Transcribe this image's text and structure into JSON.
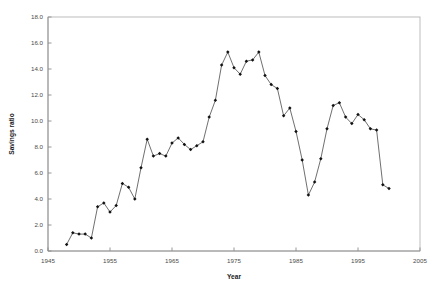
{
  "chart_data": {
    "type": "line",
    "title": "",
    "xlabel": "Year",
    "ylabel": "Savings ratio",
    "xlim": [
      1945,
      2005
    ],
    "ylim": [
      0.0,
      18.0
    ],
    "xticks": [
      1945,
      1955,
      1965,
      1975,
      1985,
      1995,
      2005
    ],
    "xtick_labels": [
      "1945",
      "1955",
      "1965",
      "1975",
      "1985",
      "1995",
      "2005"
    ],
    "yticks": [
      0.0,
      2.0,
      4.0,
      6.0,
      8.0,
      10.0,
      12.0,
      14.0,
      16.0,
      18.0
    ],
    "ytick_labels": [
      "0.0",
      "2.0",
      "4.0",
      "6.0",
      "8.0",
      "10.0",
      "12.0",
      "14.0",
      "16.0",
      "18.0"
    ],
    "grid": false,
    "legend": false,
    "marker": "filled-diamond",
    "line_color": "#555555",
    "marker_color": "#111111",
    "series": [
      {
        "name": "Savings ratio",
        "x": [
          1948,
          1949,
          1950,
          1951,
          1952,
          1953,
          1954,
          1955,
          1956,
          1957,
          1958,
          1959,
          1960,
          1961,
          1962,
          1963,
          1964,
          1965,
          1966,
          1967,
          1968,
          1969,
          1970,
          1971,
          1972,
          1973,
          1974,
          1975,
          1976,
          1977,
          1978,
          1979,
          1980,
          1981,
          1982,
          1983,
          1984,
          1985,
          1986,
          1987,
          1988,
          1989,
          1990,
          1991,
          1992,
          1993,
          1994,
          1995,
          1996,
          1997,
          1998,
          1999,
          2000
        ],
        "values": [
          0.5,
          1.4,
          1.3,
          1.3,
          1.0,
          3.4,
          3.7,
          3.0,
          3.5,
          5.2,
          4.9,
          4.0,
          6.4,
          8.6,
          7.3,
          7.5,
          7.3,
          8.3,
          8.7,
          8.2,
          7.8,
          8.1,
          8.4,
          10.3,
          11.6,
          14.3,
          15.3,
          14.1,
          13.6,
          14.6,
          14.7,
          15.3,
          13.5,
          12.8,
          12.5,
          10.4,
          11.0,
          9.2,
          7.0,
          4.3,
          5.3,
          7.1,
          9.4,
          11.2,
          11.4,
          10.3,
          9.8,
          10.5,
          10.1,
          9.4,
          9.3,
          5.1,
          4.8
        ]
      }
    ]
  },
  "layout": {
    "plot_left": 48,
    "plot_right": 420,
    "plot_top": 17,
    "plot_bottom": 251
  }
}
